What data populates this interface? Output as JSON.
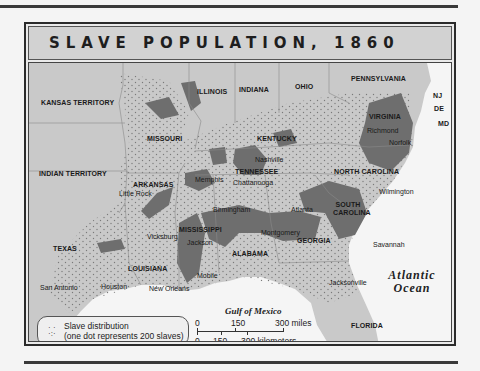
{
  "title": "SLAVE POPULATION, 1860",
  "regions": {
    "states": [
      {
        "name": "KANSAS TERRITORY",
        "x": 12,
        "y": 36
      },
      {
        "name": "MISSOURI",
        "x": 118,
        "y": 72
      },
      {
        "name": "ILLINOIS",
        "x": 168,
        "y": 25
      },
      {
        "name": "INDIANA",
        "x": 210,
        "y": 23
      },
      {
        "name": "OHIO",
        "x": 266,
        "y": 20
      },
      {
        "name": "PENNSYLVANIA",
        "x": 322,
        "y": 12
      },
      {
        "name": "NJ",
        "x": 404,
        "y": 29
      },
      {
        "name": "DE",
        "x": 405,
        "y": 42
      },
      {
        "name": "MD",
        "x": 409,
        "y": 57
      },
      {
        "name": "VIRGINIA",
        "x": 340,
        "y": 50
      },
      {
        "name": "KENTUCKY",
        "x": 228,
        "y": 72
      },
      {
        "name": "INDIAN TERRITORY",
        "x": 10,
        "y": 107
      },
      {
        "name": "ARKANSAS",
        "x": 104,
        "y": 118
      },
      {
        "name": "TENNESSEE",
        "x": 206,
        "y": 105
      },
      {
        "name": "NORTH CAROLINA",
        "x": 305,
        "y": 105
      },
      {
        "name": "SOUTH CAROLINA",
        "x": 304,
        "y": 138
      },
      {
        "name": "MISSISSIPPI",
        "x": 150,
        "y": 163
      },
      {
        "name": "ALABAMA",
        "x": 203,
        "y": 187
      },
      {
        "name": "GEORGIA",
        "x": 268,
        "y": 174
      },
      {
        "name": "TEXAS",
        "x": 24,
        "y": 182
      },
      {
        "name": "LOUISIANA",
        "x": 99,
        "y": 202
      },
      {
        "name": "FLORIDA",
        "x": 322,
        "y": 259
      }
    ],
    "cities": [
      {
        "name": "Richmond",
        "x": 343,
        "y": 65
      },
      {
        "name": "Norfolk",
        "x": 364,
        "y": 77
      },
      {
        "name": "Nashville",
        "x": 224,
        "y": 94
      },
      {
        "name": "Memphis",
        "x": 163,
        "y": 114
      },
      {
        "name": "Chattanooga",
        "x": 206,
        "y": 117
      },
      {
        "name": "Little Rock",
        "x": 97,
        "y": 128
      },
      {
        "name": "Wilmington",
        "x": 355,
        "y": 125
      },
      {
        "name": "Birmingham",
        "x": 185,
        "y": 144
      },
      {
        "name": "Atlanta",
        "x": 259,
        "y": 144
      },
      {
        "name": "Vicksburg",
        "x": 120,
        "y": 168
      },
      {
        "name": "Jackson",
        "x": 162,
        "y": 175
      },
      {
        "name": "Montgomery",
        "x": 232,
        "y": 167
      },
      {
        "name": "Savannah",
        "x": 346,
        "y": 178
      },
      {
        "name": "Mobile",
        "x": 171,
        "y": 209
      },
      {
        "name": "San Antonio",
        "x": 11,
        "y": 221
      },
      {
        "name": "Houston",
        "x": 72,
        "y": 221
      },
      {
        "name": "New Orleans",
        "x": 120,
        "y": 222
      },
      {
        "name": "Jacksonville",
        "x": 300,
        "y": 216
      }
    ],
    "water": {
      "atlantic": "Atlantic\nOcean",
      "gulf": "Gulf of Mexico"
    }
  },
  "legend": {
    "line1": "Slave distribution",
    "line2": "(one dot represents 200 slaves)"
  },
  "scale": {
    "miles": [
      "0",
      "150",
      "300 miles"
    ],
    "km": [
      "0",
      "150",
      "300 kilometers"
    ]
  },
  "colors": {
    "land": "#c9c9c9",
    "dense": "#6e6e6e",
    "water": "#f5f5f5",
    "dots": "#7a7a7a"
  }
}
